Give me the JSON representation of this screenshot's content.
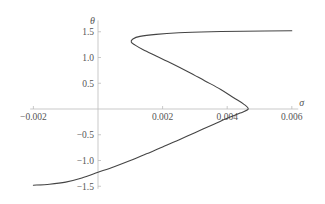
{
  "chart_data": {
    "type": "line",
    "title": "",
    "xlabel": "σ",
    "ylabel": "θ",
    "xlim": [
      -0.0021,
      0.0062
    ],
    "ylim": [
      -1.55,
      1.72
    ],
    "grid": false,
    "legend": null,
    "x_ticks": [
      {
        "value": -0.002,
        "label": "-0.002"
      },
      {
        "value": 0.002,
        "label": "0.002"
      },
      {
        "value": 0.004,
        "label": "0.004"
      },
      {
        "value": 0.006,
        "label": "0.006"
      }
    ],
    "y_ticks": [
      {
        "value": 1.5,
        "label": "1.5"
      },
      {
        "value": 1.0,
        "label": "1.0"
      },
      {
        "value": 0.5,
        "label": "0.5"
      },
      {
        "value": -0.5,
        "label": "-0.5"
      },
      {
        "value": -1.0,
        "label": "-1.0"
      },
      {
        "value": -1.5,
        "label": "-1.5"
      }
    ],
    "series": [
      {
        "name": "θ(σ)",
        "color": "#444444",
        "points": [
          [
            -0.002,
            -1.48
          ],
          [
            -0.0015,
            -1.46
          ],
          [
            -0.001,
            -1.42
          ],
          [
            -0.0005,
            -1.34
          ],
          [
            0.0,
            -1.23
          ],
          [
            0.0005,
            -1.12
          ],
          [
            0.001,
            -1.0
          ],
          [
            0.0015,
            -0.87
          ],
          [
            0.002,
            -0.74
          ],
          [
            0.0025,
            -0.6
          ],
          [
            0.003,
            -0.46
          ],
          [
            0.0035,
            -0.32
          ],
          [
            0.004,
            -0.18
          ],
          [
            0.0044,
            -0.08
          ],
          [
            0.00465,
            0.0
          ],
          [
            0.0045,
            0.1
          ],
          [
            0.0042,
            0.22
          ],
          [
            0.0038,
            0.38
          ],
          [
            0.0033,
            0.55
          ],
          [
            0.0028,
            0.72
          ],
          [
            0.0023,
            0.88
          ],
          [
            0.0018,
            1.03
          ],
          [
            0.0014,
            1.15
          ],
          [
            0.00115,
            1.24
          ],
          [
            0.00103,
            1.3
          ],
          [
            0.00108,
            1.36
          ],
          [
            0.0013,
            1.41
          ],
          [
            0.0018,
            1.45
          ],
          [
            0.0025,
            1.48
          ],
          [
            0.0035,
            1.5
          ],
          [
            0.0045,
            1.51
          ],
          [
            0.006,
            1.52
          ]
        ]
      }
    ]
  },
  "style": {
    "axis_color": "#bbbbbb",
    "curve_color": "#444444",
    "text_color": "#555555"
  }
}
